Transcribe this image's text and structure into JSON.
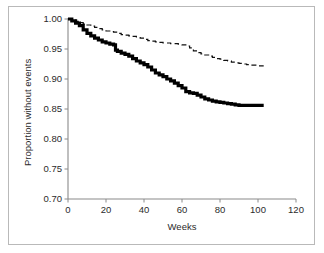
{
  "figure": {
    "background": "#ffffff",
    "frame_color": "#b9b9b9",
    "axis_color": "#8a8a8a",
    "text_color": "#2b2b2b"
  },
  "chart_data": {
    "type": "line",
    "title": "",
    "subtitle": "",
    "xlabel": "Weeks",
    "ylabel": "Proportion without events",
    "xlim": [
      0,
      120
    ],
    "ylim": [
      0.7,
      1.0
    ],
    "xticks": [
      0,
      20,
      40,
      60,
      80,
      100,
      120
    ],
    "xtick_labels": [
      "0",
      "20",
      "40",
      "60",
      "80",
      "100",
      "120"
    ],
    "yticks": [
      0.7,
      0.75,
      0.8,
      0.85,
      0.9,
      0.95,
      1.0
    ],
    "ytick_labels": [
      "0.70",
      "0.75",
      "0.80",
      "0.85",
      "0.90",
      "0.95",
      "1.00"
    ],
    "grid": false,
    "legend": false,
    "legend_position": "none",
    "annotations": [],
    "series": [
      {
        "name": "upper-curve-dashed",
        "style": "dashed",
        "color": "#111111",
        "line_width": 1.2,
        "step": true,
        "x": [
          0,
          2,
          4,
          6,
          8,
          10,
          12,
          14,
          16,
          18,
          20,
          22,
          24,
          26,
          28,
          30,
          32,
          34,
          36,
          38,
          40,
          42,
          44,
          46,
          48,
          50,
          52,
          54,
          56,
          58,
          60,
          62,
          64,
          66,
          68,
          70,
          72,
          74,
          76,
          78,
          80,
          82,
          84,
          86,
          88,
          90,
          92,
          94,
          96,
          98,
          100,
          103
        ],
        "y": [
          1.0,
          0.998,
          0.996,
          0.994,
          0.992,
          0.99,
          0.988,
          0.986,
          0.984,
          0.982,
          0.98,
          0.979,
          0.978,
          0.976,
          0.974,
          0.973,
          0.972,
          0.971,
          0.97,
          0.968,
          0.966,
          0.964,
          0.963,
          0.962,
          0.961,
          0.96,
          0.96,
          0.959,
          0.959,
          0.958,
          0.957,
          0.955,
          0.952,
          0.947,
          0.944,
          0.942,
          0.94,
          0.938,
          0.936,
          0.934,
          0.933,
          0.931,
          0.93,
          0.928,
          0.927,
          0.926,
          0.925,
          0.924,
          0.923,
          0.923,
          0.922,
          0.922
        ]
      },
      {
        "name": "lower-curve-solid",
        "style": "solid",
        "color": "#000000",
        "line_width": 3.2,
        "step": true,
        "x": [
          0,
          2,
          4,
          6,
          8,
          10,
          12,
          14,
          16,
          18,
          20,
          22,
          24,
          25,
          26,
          28,
          30,
          32,
          34,
          36,
          38,
          40,
          42,
          44,
          46,
          48,
          50,
          52,
          54,
          56,
          58,
          60,
          62,
          64,
          66,
          68,
          70,
          72,
          74,
          76,
          78,
          80,
          82,
          84,
          86,
          88,
          90,
          92,
          94,
          96,
          98,
          100,
          103
        ],
        "y": [
          1.0,
          0.997,
          0.993,
          0.989,
          0.982,
          0.976,
          0.972,
          0.968,
          0.965,
          0.962,
          0.96,
          0.958,
          0.957,
          0.948,
          0.946,
          0.943,
          0.941,
          0.938,
          0.934,
          0.93,
          0.927,
          0.924,
          0.92,
          0.915,
          0.91,
          0.907,
          0.904,
          0.9,
          0.897,
          0.893,
          0.889,
          0.885,
          0.879,
          0.877,
          0.876,
          0.873,
          0.87,
          0.867,
          0.865,
          0.863,
          0.862,
          0.861,
          0.86,
          0.859,
          0.858,
          0.857,
          0.856,
          0.856,
          0.856,
          0.856,
          0.856,
          0.856,
          0.856
        ]
      }
    ]
  }
}
